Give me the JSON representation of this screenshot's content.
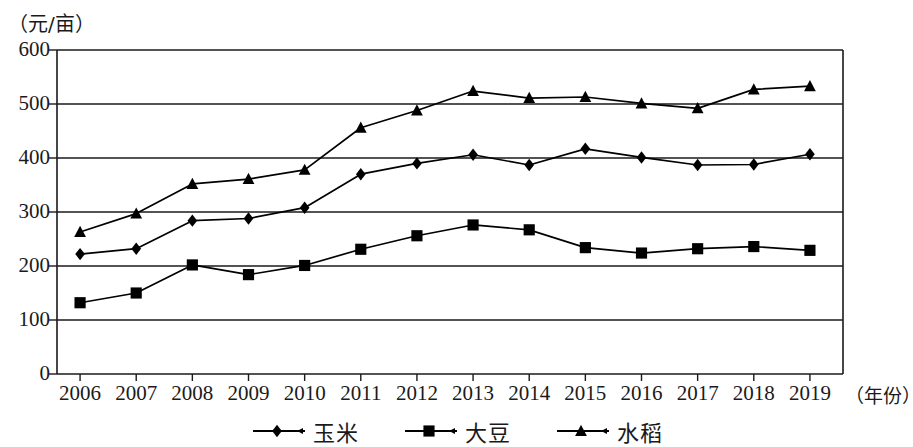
{
  "chart_data": {
    "type": "line",
    "title": "",
    "subtitle": "",
    "ylabel": "（元/亩）",
    "xlabel": "（年份）",
    "x": [
      "2006",
      "2007",
      "2008",
      "2009",
      "2010",
      "2011",
      "2012",
      "2013",
      "2014",
      "2015",
      "2016",
      "2017",
      "2018",
      "2019"
    ],
    "categories": [
      "2006",
      "2007",
      "2008",
      "2009",
      "2010",
      "2011",
      "2012",
      "2013",
      "2014",
      "2015",
      "2016",
      "2017",
      "2018",
      "2019"
    ],
    "ylim": [
      0,
      600
    ],
    "yticks": [
      "0",
      "100",
      "200",
      "300",
      "400",
      "500",
      "600"
    ],
    "xlim_note": "2006-2019",
    "grid": "horizontal",
    "legend_position": "bottom-center",
    "series": [
      {
        "name": "玉米",
        "marker": "diamond",
        "color": "#000000",
        "values": [
          222,
          232,
          284,
          288,
          308,
          370,
          390,
          406,
          387,
          417,
          401,
          387,
          388,
          407
        ]
      },
      {
        "name": "大豆",
        "marker": "square",
        "color": "#000000",
        "values": [
          132,
          150,
          202,
          184,
          201,
          231,
          256,
          276,
          267,
          234,
          224,
          232,
          236,
          229
        ]
      },
      {
        "name": "水稻",
        "marker": "triangle",
        "color": "#000000",
        "values": [
          263,
          297,
          352,
          361,
          378,
          456,
          488,
          524,
          511,
          513,
          501,
          492,
          527,
          533
        ]
      }
    ]
  },
  "legend": {
    "items": [
      {
        "label": "玉米",
        "marker": "diamond"
      },
      {
        "label": "大豆",
        "marker": "square"
      },
      {
        "label": "水稻",
        "marker": "triangle"
      }
    ]
  }
}
